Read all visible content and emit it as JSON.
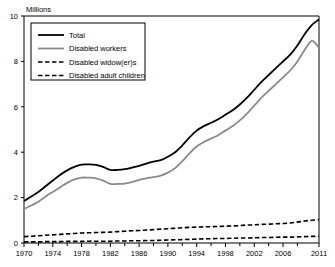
{
  "chart_data": {
    "type": "line",
    "title": "",
    "subtitle": "",
    "unit_label": "Millions",
    "xlabel": "",
    "ylabel": "",
    "xlim": [
      1970,
      2011
    ],
    "ylim": [
      0,
      10
    ],
    "y_ticks": [
      0,
      2,
      4,
      6,
      8,
      10
    ],
    "y_tick_labels": [
      "0",
      "2",
      "4",
      "6",
      "8",
      "10"
    ],
    "x_tick_labels": [
      "1970",
      "1974",
      "1978",
      "1982",
      "1986",
      "1990",
      "1994",
      "1998",
      "2002",
      "2006",
      "2011"
    ],
    "x_tick_values": [
      1970,
      1974,
      1978,
      1982,
      1986,
      1990,
      1994,
      1998,
      2002,
      2006,
      2011
    ],
    "x_minor_ticks": [
      1972,
      1976,
      1980,
      1984,
      1988,
      1992,
      1996,
      2000,
      2004,
      2008
    ],
    "grid": false,
    "legend_position": "top-left",
    "x": [
      1970,
      1971,
      1972,
      1973,
      1974,
      1975,
      1976,
      1977,
      1978,
      1979,
      1980,
      1981,
      1982,
      1983,
      1984,
      1985,
      1986,
      1987,
      1988,
      1989,
      1990,
      1991,
      1992,
      1993,
      1994,
      1995,
      1996,
      1997,
      1998,
      1999,
      2000,
      2001,
      2002,
      2003,
      2004,
      2005,
      2006,
      2007,
      2008,
      2009,
      2010,
      2011
    ],
    "series": [
      {
        "name": "Total",
        "color": "#000000",
        "style": "solid",
        "width": 1.8,
        "values": [
          1.85,
          2.05,
          2.25,
          2.5,
          2.75,
          3.0,
          3.2,
          3.35,
          3.45,
          3.46,
          3.44,
          3.35,
          3.22,
          3.22,
          3.25,
          3.32,
          3.4,
          3.5,
          3.58,
          3.65,
          3.8,
          4.0,
          4.3,
          4.65,
          4.95,
          5.15,
          5.3,
          5.45,
          5.65,
          5.85,
          6.1,
          6.4,
          6.75,
          7.1,
          7.4,
          7.7,
          8.0,
          8.3,
          8.7,
          9.2,
          9.6,
          9.85
        ]
      },
      {
        "name": "Disabled workers",
        "color": "#8a8a8a",
        "style": "solid",
        "width": 1.8,
        "values": [
          1.5,
          1.65,
          1.82,
          2.05,
          2.25,
          2.45,
          2.65,
          2.8,
          2.88,
          2.88,
          2.85,
          2.75,
          2.6,
          2.6,
          2.62,
          2.68,
          2.78,
          2.85,
          2.9,
          2.97,
          3.1,
          3.3,
          3.6,
          3.95,
          4.25,
          4.45,
          4.6,
          4.75,
          4.95,
          5.15,
          5.4,
          5.7,
          6.05,
          6.4,
          6.7,
          7.0,
          7.3,
          7.6,
          8.0,
          8.5,
          8.9,
          8.6
        ]
      },
      {
        "name": "Disabled widow(er)s",
        "color": "#000000",
        "style": "dashed",
        "width": 1.6,
        "values": [
          0.28,
          0.3,
          0.32,
          0.34,
          0.36,
          0.38,
          0.4,
          0.42,
          0.44,
          0.45,
          0.46,
          0.47,
          0.48,
          0.5,
          0.52,
          0.54,
          0.55,
          0.57,
          0.59,
          0.61,
          0.63,
          0.65,
          0.67,
          0.69,
          0.7,
          0.71,
          0.72,
          0.73,
          0.74,
          0.75,
          0.77,
          0.79,
          0.8,
          0.82,
          0.83,
          0.85,
          0.86,
          0.88,
          0.92,
          0.97,
          1.0,
          1.03
        ]
      },
      {
        "name": "Disabled adult children",
        "color": "#000000",
        "style": "dashed",
        "width": 1.6,
        "values": [
          0.05,
          0.05,
          0.05,
          0.06,
          0.06,
          0.06,
          0.07,
          0.07,
          0.07,
          0.08,
          0.08,
          0.08,
          0.08,
          0.09,
          0.09,
          0.1,
          0.1,
          0.11,
          0.11,
          0.12,
          0.13,
          0.14,
          0.15,
          0.16,
          0.17,
          0.18,
          0.19,
          0.2,
          0.2,
          0.21,
          0.22,
          0.22,
          0.23,
          0.24,
          0.24,
          0.25,
          0.26,
          0.26,
          0.27,
          0.28,
          0.29,
          0.3
        ]
      }
    ]
  },
  "legend": {
    "items": [
      {
        "label": "Total"
      },
      {
        "label": "Disabled workers"
      },
      {
        "label": "Disabled widow(er)s"
      },
      {
        "label": "Disabled adult children"
      }
    ]
  }
}
